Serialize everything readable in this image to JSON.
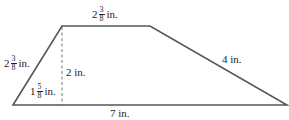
{
  "diagram": {
    "type": "trapezoid",
    "stroke_color": "#555555",
    "labels": {
      "top": {
        "whole": "2",
        "num": "3",
        "den": "8",
        "unit": "in."
      },
      "left_side": {
        "whole": "2",
        "num": "3",
        "den": "8",
        "unit": "in."
      },
      "height": {
        "text": "2 in."
      },
      "bottom_left_segment": {
        "whole": "1",
        "num": "5",
        "den": "8",
        "unit": "in."
      },
      "right_side": {
        "text": "4 in."
      },
      "bottom": {
        "text": "7 in."
      }
    }
  }
}
